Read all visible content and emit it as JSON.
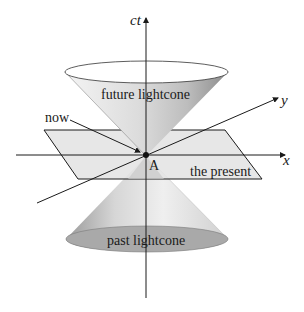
{
  "diagram": {
    "type": "spacetime lightcone diagram",
    "axes": {
      "time": {
        "label": "ct"
      },
      "x": {
        "label": "x"
      },
      "y": {
        "label": "y"
      }
    },
    "labels": {
      "future_cone": "future lightcone",
      "past_cone": "past lightcone",
      "now": "now",
      "event": "A",
      "plane": "the present"
    },
    "colors": {
      "line": "#1a1a1a",
      "plane_fill": "#e2e2e2",
      "cone_light": "#f2f2f2",
      "cone_dark": "#9a9a9a",
      "past_ellipse": "#a8a8a8",
      "future_ellipse": "#ffffff"
    }
  }
}
